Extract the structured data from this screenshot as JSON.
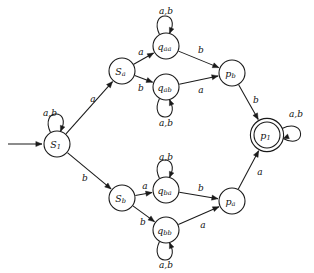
{
  "diagram": {
    "alphabet": [
      "a",
      "b"
    ],
    "start_state": "S1",
    "accepting_states": [
      "p1"
    ],
    "colors": {
      "stroke": "#1a1a1a",
      "node_fill": "#ffffff",
      "background": "#ffffff",
      "text": "#111111"
    }
  },
  "nodes": [
    {
      "id": "S1",
      "base": "S",
      "sub": "1",
      "x": 57,
      "y": 144,
      "r": 13,
      "accepting": false,
      "start": true
    },
    {
      "id": "Sa",
      "base": "S",
      "sub": "a",
      "x": 122,
      "y": 71,
      "r": 13,
      "accepting": false,
      "start": false
    },
    {
      "id": "qaa",
      "base": "q",
      "sub": "aa",
      "x": 166,
      "y": 46,
      "r": 13,
      "accepting": false,
      "start": false
    },
    {
      "id": "qab",
      "base": "q",
      "sub": "ab",
      "x": 166,
      "y": 87,
      "r": 13,
      "accepting": false,
      "start": false
    },
    {
      "id": "pb",
      "base": "p",
      "sub": "b",
      "x": 232,
      "y": 73,
      "r": 13,
      "accepting": false,
      "start": false
    },
    {
      "id": "p1",
      "base": "p",
      "sub": "1",
      "x": 267,
      "y": 135,
      "r": 13,
      "accepting": true,
      "start": false
    },
    {
      "id": "Sb",
      "base": "S",
      "sub": "b",
      "x": 122,
      "y": 198,
      "r": 13,
      "accepting": false,
      "start": false
    },
    {
      "id": "qba",
      "base": "q",
      "sub": "ba",
      "x": 166,
      "y": 190,
      "r": 13,
      "accepting": false,
      "start": false
    },
    {
      "id": "qbb",
      "base": "q",
      "sub": "bb",
      "x": 166,
      "y": 230,
      "r": 13,
      "accepting": false,
      "start": false
    },
    {
      "id": "pa",
      "base": "p",
      "sub": "a",
      "x": 232,
      "y": 201,
      "r": 13,
      "accepting": false,
      "start": false
    }
  ],
  "edges": [
    {
      "from": "S1",
      "to": "Sa",
      "label": "a",
      "lx": 93,
      "ly": 99
    },
    {
      "from": "S1",
      "to": "Sb",
      "label": "b",
      "lx": 85,
      "ly": 178
    },
    {
      "from": "Sa",
      "to": "qaa",
      "label": "a",
      "lx": 141,
      "ly": 52
    },
    {
      "from": "Sa",
      "to": "qab",
      "label": "b",
      "lx": 141,
      "ly": 88
    },
    {
      "from": "qaa",
      "to": "pb",
      "label": "b",
      "lx": 201,
      "ly": 50
    },
    {
      "from": "qab",
      "to": "pb",
      "label": "a",
      "lx": 201,
      "ly": 90
    },
    {
      "from": "pb",
      "to": "p1",
      "label": "b",
      "lx": 256,
      "ly": 100
    },
    {
      "from": "Sb",
      "to": "qba",
      "label": "a",
      "lx": 145,
      "ly": 186
    },
    {
      "from": "Sb",
      "to": "qbb",
      "label": "b",
      "lx": 143,
      "ly": 222
    },
    {
      "from": "qba",
      "to": "pa",
      "label": "b",
      "lx": 201,
      "ly": 188
    },
    {
      "from": "qbb",
      "to": "pa",
      "label": "a",
      "lx": 203,
      "ly": 225
    },
    {
      "from": "pa",
      "to": "p1",
      "label": "a",
      "lx": 260,
      "ly": 172
    }
  ],
  "self_loops": [
    {
      "node": "S1",
      "label": "a,b",
      "direction": "up",
      "lx": 50,
      "ly": 113
    },
    {
      "node": "qaa",
      "label": "a,b",
      "direction": "up",
      "lx": 166,
      "ly": 11
    },
    {
      "node": "qab",
      "label": "a,b",
      "direction": "down",
      "lx": 166,
      "ly": 123
    },
    {
      "node": "qba",
      "label": "a,b",
      "direction": "up",
      "lx": 166,
      "ly": 157
    },
    {
      "node": "qbb",
      "label": "a,b",
      "direction": "down",
      "lx": 166,
      "ly": 265
    },
    {
      "node": "p1",
      "label": "a,b",
      "direction": "right",
      "lx": 296,
      "ly": 114
    }
  ],
  "start_arrow": {
    "name": "start-arrow",
    "x1": 8,
    "y1": 144,
    "x2": 42,
    "y2": 144
  }
}
